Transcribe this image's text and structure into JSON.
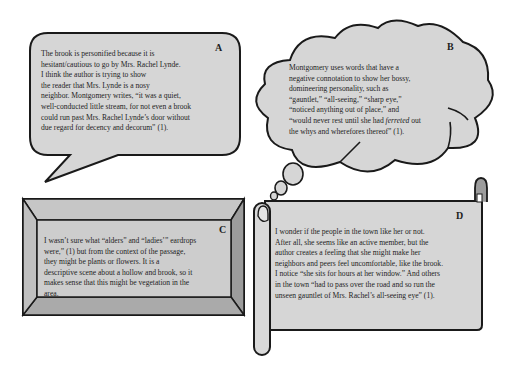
{
  "panels": {
    "a": {
      "label": "A",
      "shape": "speech-bubble",
      "lines": [
        "The brook is personified because it is",
        "hesitant/cautious to go by Mrs. Rachel Lynde.",
        "I think the author is trying to show",
        "the reader that Mrs. Lynde is a nosy",
        "neighbor. Montgomery writes, “it was a quiet,",
        "well-conducted little stream, for not even a brook",
        "could run past Mrs. Rachel Lynde’s door without",
        "due regard for decency and decorum” (1)."
      ]
    },
    "b": {
      "label": "B",
      "shape": "thought-cloud",
      "lines": [
        "Montgomery uses words that have a",
        "negative connotation to show her bossy,",
        "domineering personality, such as",
        "“gauntlet,” “all-seeing,” “sharp eye,”",
        "“noticed anything out of place,” and",
        "“would never rest until she had ",
        "the whys and wherefores thereof” (1)."
      ],
      "italic_word": "ferreted",
      "after_italic": " out"
    },
    "c": {
      "label": "C",
      "shape": "beveled-frame",
      "lines": [
        "I wasn’t sure what “alders” and “ladies’” eardrops",
        "were,” (1) but from the context of the passage,",
        "they might be plants or flowers. It is a",
        "descriptive scene about a hollow and brook, so it",
        "makes sense that this might be vegetation in the",
        "area."
      ]
    },
    "d": {
      "label": "D",
      "shape": "scroll",
      "lines": [
        "I wonder if the people in the town like her or not.",
        "After all, she seems like an active member, but the",
        "author creates a feeling that she might make her",
        "neighbors and peers feel uncomfortable, like the brook.",
        "I notice “she sits for hours at her window.” And others",
        "in the town “had to pass over the road and so run the",
        "unseen gauntlet of Mrs. Rachel’s all-seeing eye” (1)."
      ]
    }
  },
  "colors": {
    "fill": "#d6d6d6",
    "stroke": "#1a1a1a",
    "bevel_top": "#c4c4c4",
    "bevel_side": "#9a9a9a",
    "bevel_bottom": "#a8a8a8",
    "frame_inner": "#c9c9c9"
  }
}
